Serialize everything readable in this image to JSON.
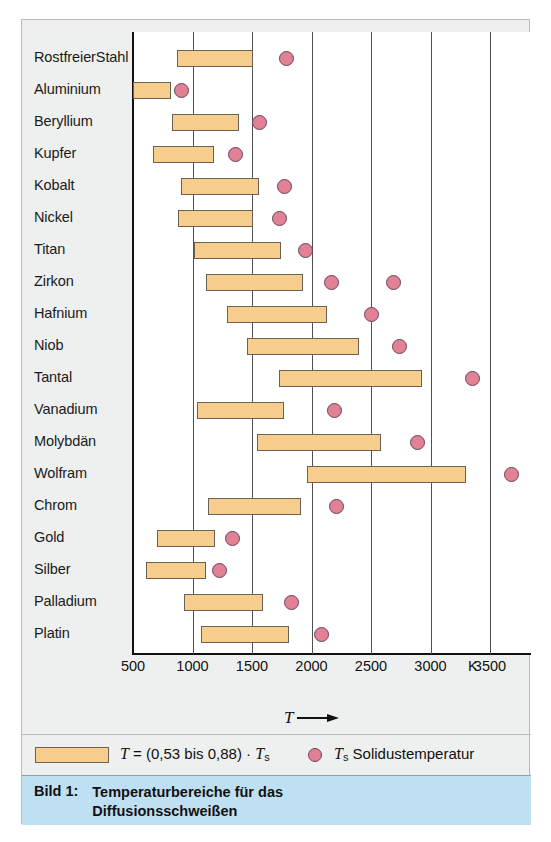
{
  "caption": {
    "label": "Bild 1:",
    "text": "Temperaturbereiche für das Diffusionsschweißen"
  },
  "axis": {
    "title_symbol": "T",
    "unit": "K",
    "ticks": [
      {
        "label": "500",
        "value": 500
      },
      {
        "label": "1000",
        "value": 1000
      },
      {
        "label": "1500",
        "value": 1500
      },
      {
        "label": "2000",
        "value": 2000
      },
      {
        "label": "2500",
        "value": 2500
      },
      {
        "label": "3000",
        "value": 3000
      },
      {
        "label": "3500",
        "value": 3500
      }
    ]
  },
  "legend": {
    "bar_text": "T = (0,53 bis 0,88) · Tₛ",
    "bar_symbol": "T",
    "bar_formula": " = (0,53 bis 0,88) · ",
    "bar_sym2": "T",
    "bar_sub2": "s",
    "dot_symbol": "T",
    "dot_sub": "s",
    "dot_text": " Solidustemperatur"
  },
  "colors": {
    "bar_fill": "#f6cd8d",
    "bar_stroke": "#6b6257",
    "dot_fill": "#e08196",
    "dot_stroke": "#6b4450",
    "caption_band": "#bfe0f2",
    "gutter": "#eef0ef",
    "canvas": "#ffffff",
    "gridline": "#4e5150",
    "axis": "#111111"
  },
  "chart_data": {
    "type": "bar",
    "orientation": "horizontal",
    "title": "Temperaturbereiche für das Diffusionsschweißen",
    "xlabel": "T",
    "ylabel": "",
    "unit": "K",
    "xlim": [
      500,
      3600
    ],
    "grid": true,
    "gridlines": [
      1000,
      1500,
      2000,
      2500,
      3000,
      3500
    ],
    "legend_position": "bottom",
    "series": [
      {
        "name": "T = (0,53 bis 0,88) · Ts",
        "type": "range-bar"
      },
      {
        "name": "Ts Solidustemperatur",
        "type": "marker"
      }
    ],
    "categories": [
      "Rostfreier Stahl",
      "Aluminium",
      "Beryllium",
      "Kupfer",
      "Kobalt",
      "Nickel",
      "Titan",
      "Zirkon",
      "Hafnium",
      "Niob",
      "Tantal",
      "Vanadium",
      "Molybdän",
      "Wolfram",
      "Chrom",
      "Gold",
      "Silber",
      "Palladium",
      "Platin"
    ],
    "rows": [
      {
        "label": "Rostfreier Stahl",
        "two_line": true,
        "label_lines": [
          "Rostfreier",
          "Stahl"
        ],
        "bar": [
          870,
          1510
        ],
        "solidus": [
          1790
        ]
      },
      {
        "label": "Aluminium",
        "two_line": false,
        "label_lines": [
          "Aluminium"
        ],
        "bar": [
          500,
          820
        ],
        "solidus": [
          910
        ]
      },
      {
        "label": "Beryllium",
        "two_line": false,
        "label_lines": [
          "Beryllium"
        ],
        "bar": [
          830,
          1390
        ],
        "solidus": [
          1560
        ]
      },
      {
        "label": "Kupfer",
        "two_line": false,
        "label_lines": [
          "Kupfer"
        ],
        "bar": [
          670,
          1180
        ],
        "solidus": [
          1360
        ]
      },
      {
        "label": "Kobalt",
        "two_line": false,
        "label_lines": [
          "Kobalt"
        ],
        "bar": [
          900,
          1560
        ],
        "solidus": [
          1770
        ]
      },
      {
        "label": "Nickel",
        "two_line": false,
        "label_lines": [
          "Nickel"
        ],
        "bar": [
          880,
          1510
        ],
        "solidus": [
          1730
        ]
      },
      {
        "label": "Titan",
        "two_line": false,
        "label_lines": [
          "Titan"
        ],
        "bar": [
          1010,
          1740
        ],
        "solidus": [
          1950
        ]
      },
      {
        "label": "Zirkon",
        "two_line": false,
        "label_lines": [
          "Zirkon"
        ],
        "bar": [
          1110,
          1930
        ],
        "solidus": [
          2170,
          2690
        ]
      },
      {
        "label": "Hafnium",
        "two_line": false,
        "label_lines": [
          "Hafnium"
        ],
        "bar": [
          1290,
          2130
        ],
        "solidus": [
          2500
        ]
      },
      {
        "label": "Niob",
        "two_line": false,
        "label_lines": [
          "Niob"
        ],
        "bar": [
          1460,
          2400
        ],
        "solidus": [
          2740
        ]
      },
      {
        "label": "Tantal",
        "two_line": false,
        "label_lines": [
          "Tantal"
        ],
        "bar": [
          1730,
          2930
        ],
        "solidus": [
          3350
        ]
      },
      {
        "label": "Vanadium",
        "two_line": false,
        "label_lines": [
          "Vanadium"
        ],
        "bar": [
          1040,
          1770
        ],
        "solidus": [
          2190
        ]
      },
      {
        "label": "Molybdän",
        "two_line": false,
        "label_lines": [
          "Molybdän"
        ],
        "bar": [
          1540,
          2580
        ],
        "solidus": [
          2890
        ]
      },
      {
        "label": "Wolfram",
        "two_line": false,
        "label_lines": [
          "Wolfram"
        ],
        "bar": [
          1960,
          3300
        ],
        "solidus": [
          3680
        ]
      },
      {
        "label": "Chrom",
        "two_line": false,
        "label_lines": [
          "Chrom"
        ],
        "bar": [
          1130,
          1910
        ],
        "solidus": [
          2210
        ]
      },
      {
        "label": "Gold",
        "two_line": false,
        "label_lines": [
          "Gold"
        ],
        "bar": [
          700,
          1190
        ],
        "solidus": [
          1340
        ]
      },
      {
        "label": "Silber",
        "two_line": false,
        "label_lines": [
          "Silber"
        ],
        "bar": [
          610,
          1110
        ],
        "solidus": [
          1230
        ]
      },
      {
        "label": "Palladium",
        "two_line": false,
        "label_lines": [
          "Palladium"
        ],
        "bar": [
          930,
          1590
        ],
        "solidus": [
          1830
        ]
      },
      {
        "label": "Platin",
        "two_line": false,
        "label_lines": [
          "Platin"
        ],
        "bar": [
          1070,
          1810
        ],
        "solidus": [
          2080
        ]
      }
    ]
  }
}
